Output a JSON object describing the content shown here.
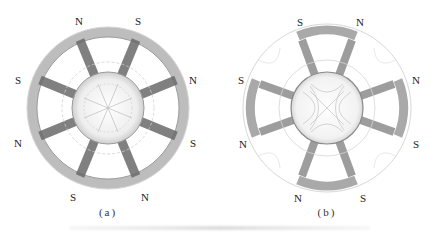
{
  "figure": {
    "panels": [
      {
        "id": "a",
        "caption": "(a)",
        "poles": 8,
        "labels": {
          "top_left": "N",
          "top_right": "S",
          "left_upper": "S",
          "right_upper": "N",
          "left_lower": "N",
          "right_lower": "S",
          "bottom_left": "S",
          "bottom_right": "N"
        }
      },
      {
        "id": "b",
        "caption": "(b)",
        "poles": 6,
        "labels": {
          "top_left": "S",
          "top_right": "N",
          "left_upper": "S",
          "right_upper": "N",
          "left_lower": "N",
          "right_lower": "S",
          "bottom_left": "N",
          "bottom_right": "S"
        }
      }
    ],
    "colors": {
      "flux_dark": "#555555",
      "flux_mid": "#8a8a8a",
      "flux_light": "#c8c8c8",
      "text": "#222222"
    }
  }
}
